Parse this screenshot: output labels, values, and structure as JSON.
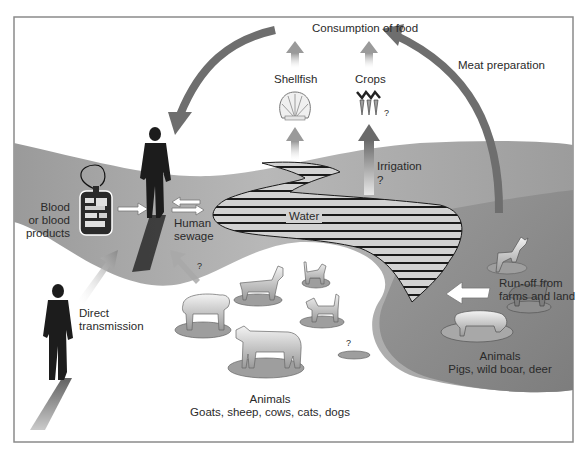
{
  "diagram": {
    "title_node": "Consumption of food",
    "food_sources": [
      {
        "label": "Shellfish",
        "icon": "shell-icon"
      },
      {
        "label": "Crops",
        "icon": "carrots-icon",
        "uncertain_mark": "?"
      }
    ],
    "pathways": {
      "meat_preparation": "Meat preparation",
      "irrigation": "Irrigation",
      "irrigation_uncertain": "?",
      "water": "Water",
      "runoff_line1": "Run-off from",
      "runoff_line2": "farms and land",
      "direct_line1": "Direct",
      "direct_line2": "transmission",
      "animal_to_human_uncertain": "?"
    },
    "human_nodes": {
      "blood_line1": "Blood",
      "blood_line2": "or blood",
      "blood_line3": "products",
      "sewage_line1": "Human",
      "sewage_line2": "sewage"
    },
    "animal_groups": [
      {
        "title": "Animals",
        "members": "Goats, sheep, cows, cats, dogs",
        "icons": [
          "sheep-icon",
          "goat-icon",
          "cat-icon",
          "dog-icon",
          "cow-icon"
        ],
        "unknown_host_mark": "?"
      },
      {
        "title": "Animals",
        "members": "Pigs, wild boar, deer",
        "icons": [
          "deer-icon",
          "wild-boar-icon",
          "pig-icon"
        ]
      }
    ],
    "colors": {
      "background": "#ffffff",
      "frame": "#8a8a8a",
      "land_light": "#b9b9b9",
      "land_dark": "#8f8f8f",
      "arrow_dark": "#6e6e6e",
      "water_stripe": "#1a1a1a",
      "water_fill": "#cfcfcf",
      "silhouette": "#1c1c1c"
    }
  }
}
